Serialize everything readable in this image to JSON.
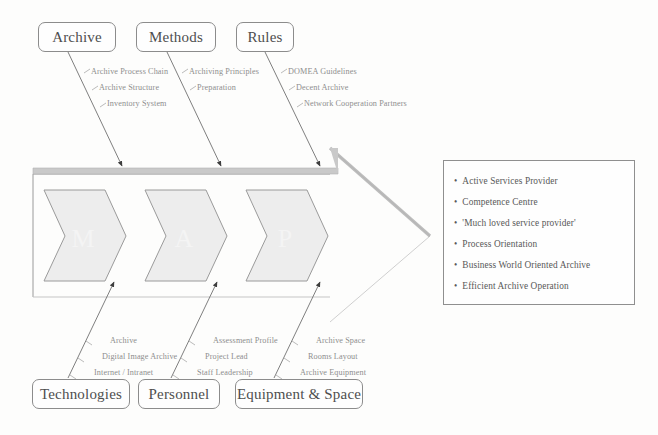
{
  "diagram": {
    "type": "fishbone",
    "spine_letters": [
      "M",
      "A",
      "P"
    ],
    "colors": {
      "background": "#fdfdfc",
      "line": "#8c8c8c",
      "text": "#5a5a5a",
      "sub_text": "#8e8e8e",
      "chevron_fill": "#ededed",
      "chevron_stroke": "#9a9a9a",
      "spine_fill": "#c9c9c9"
    }
  },
  "top_branches": [
    {
      "label": "Archive",
      "items": [
        "Archive Process Chain",
        "Archive Structure",
        "Inventory System"
      ]
    },
    {
      "label": "Methods",
      "items": [
        "Archiving Principles",
        "Preparation"
      ]
    },
    {
      "label": "Rules",
      "items": [
        "DOMEA Guidelines",
        "Decent Archive",
        "Network Cooperation Partners"
      ]
    }
  ],
  "bottom_branches": [
    {
      "label": "Technologies",
      "items": [
        "Archive",
        "Digital Image Archive",
        "Internet / Intranet"
      ]
    },
    {
      "label": "Personnel",
      "items": [
        "Assessment Profile",
        "Project Lead",
        "Staff Leadership"
      ]
    },
    {
      "label": "Equipment & Space",
      "items": [
        "Archive Space",
        "Rooms Layout",
        "Archive Equipment"
      ]
    }
  ],
  "results": {
    "items": [
      "Active Services Provider",
      "Competence Centre",
      "'Much loved service provider'",
      "Process Orientation",
      "Business World Oriented Archive",
      "Efficient Archive Operation"
    ]
  }
}
